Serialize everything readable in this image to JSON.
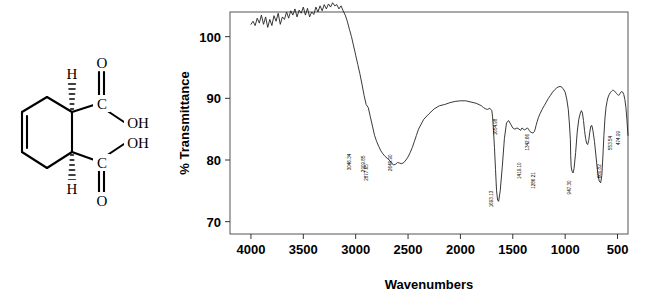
{
  "figure": {
    "caption": "",
    "structure": {
      "name": "cyclohex-4-ene-1,2-dicarboxylic acid",
      "atom_labels": [
        "H",
        "O",
        "OH",
        "OH",
        "O",
        "H",
        "C",
        "C"
      ],
      "top_h": "H",
      "bottom_h": "H",
      "top_carbonyl_o": "O",
      "bottom_carbonyl_o": "O",
      "top_hydroxyl": "OH",
      "bottom_hydroxyl": "OH",
      "top_c": "C",
      "bottom_c": "C"
    }
  },
  "chart_data": {
    "type": "line",
    "title": "",
    "xlabel": "Wavenumbers",
    "ylabel": "% Transmittance",
    "xlim": [
      4200,
      400
    ],
    "ylim": [
      68,
      104
    ],
    "xticks": [
      4000,
      3500,
      3000,
      2500,
      2000,
      1500,
      1000,
      500
    ],
    "xticklabels": [
      "4000",
      "3500",
      "3000",
      "2500",
      "2000",
      "1500",
      "1000",
      "500"
    ],
    "yticks": [
      70,
      80,
      90,
      100
    ],
    "yticklabels": [
      "70",
      "80",
      "90",
      "100"
    ],
    "grid": false,
    "legend": null,
    "axis_inverted_x": true,
    "line_color": "#222222",
    "annotations": [
      {
        "label": "3046.34",
        "x": 3046.34,
        "y": 79.3
      },
      {
        "label": "2909.85",
        "x": 2909.85,
        "y": 79.0
      },
      {
        "label": "2877.65",
        "x": 2877.65,
        "y": 77.6
      },
      {
        "label": "2649.90",
        "x": 2649.9,
        "y": 79.2
      },
      {
        "label": "1654.98",
        "x": 1654.98,
        "y": 85.0
      },
      {
        "label": "1693.13",
        "x": 1693.13,
        "y": 73.3
      },
      {
        "label": "1419.10",
        "x": 1419.1,
        "y": 77.9
      },
      {
        "label": "1342.66",
        "x": 1342.66,
        "y": 82.5
      },
      {
        "label": "1286.21",
        "x": 1286.21,
        "y": 76.3
      },
      {
        "label": "947.30",
        "x": 947.3,
        "y": 75.4
      },
      {
        "label": "660.82",
        "x": 660.82,
        "y": 78.0
      },
      {
        "label": "553.54",
        "x": 553.54,
        "y": 82.6
      },
      {
        "label": "474.99",
        "x": 474.99,
        "y": 83.4
      }
    ],
    "x": [
      4000,
      3980,
      3960,
      3940,
      3920,
      3900,
      3880,
      3860,
      3840,
      3820,
      3800,
      3780,
      3760,
      3740,
      3720,
      3700,
      3680,
      3660,
      3640,
      3620,
      3600,
      3580,
      3560,
      3540,
      3520,
      3500,
      3480,
      3460,
      3440,
      3420,
      3400,
      3380,
      3360,
      3340,
      3320,
      3300,
      3280,
      3260,
      3240,
      3220,
      3200,
      3180,
      3160,
      3140,
      3120,
      3100,
      3080,
      3060,
      3040,
      3020,
      3000,
      2980,
      2960,
      2940,
      2920,
      2900,
      2880,
      2860,
      2840,
      2820,
      2800,
      2780,
      2760,
      2740,
      2720,
      2700,
      2680,
      2660,
      2640,
      2620,
      2600,
      2580,
      2560,
      2540,
      2520,
      2500,
      2480,
      2460,
      2440,
      2420,
      2400,
      2350,
      2300,
      2250,
      2200,
      2150,
      2100,
      2050,
      2000,
      1950,
      1900,
      1850,
      1800,
      1780,
      1760,
      1740,
      1720,
      1700,
      1693,
      1685,
      1675,
      1665,
      1655,
      1645,
      1635,
      1620,
      1600,
      1580,
      1560,
      1540,
      1520,
      1500,
      1480,
      1460,
      1440,
      1425,
      1419,
      1412,
      1400,
      1390,
      1375,
      1360,
      1350,
      1343,
      1335,
      1325,
      1315,
      1305,
      1295,
      1286,
      1278,
      1268,
      1255,
      1240,
      1220,
      1200,
      1180,
      1160,
      1140,
      1120,
      1100,
      1080,
      1060,
      1040,
      1020,
      1000,
      985,
      970,
      960,
      950,
      947,
      943,
      935,
      925,
      915,
      900,
      885,
      870,
      855,
      845,
      835,
      825,
      815,
      805,
      795,
      785,
      775,
      765,
      755,
      745,
      735,
      720,
      705,
      690,
      675,
      661,
      650,
      640,
      630,
      620,
      610,
      600,
      590,
      580,
      570,
      560,
      554,
      548,
      540,
      530,
      520,
      510,
      500,
      490,
      480,
      475,
      468,
      460,
      450,
      440,
      430,
      420,
      410,
      400
    ],
    "y": [
      102.0,
      102.5,
      101.8,
      103.0,
      102.2,
      103.5,
      102.0,
      103.2,
      101.5,
      102.8,
      101.8,
      103.4,
      102.5,
      103.8,
      102.0,
      103.2,
      102.8,
      104.0,
      103.0,
      104.2,
      103.5,
      104.5,
      103.2,
      104.3,
      103.8,
      104.8,
      103.5,
      104.6,
      103.2,
      104.0,
      103.6,
      104.8,
      104.0,
      105.0,
      104.2,
      105.2,
      104.5,
      105.3,
      104.8,
      105.5,
      105.0,
      105.2,
      104.5,
      105.0,
      104.2,
      103.5,
      102.5,
      101.2,
      100.0,
      98.5,
      97.0,
      95.5,
      94.0,
      92.3,
      90.5,
      89.0,
      88.5,
      87.0,
      85.5,
      84.0,
      83.0,
      82.2,
      81.5,
      81.0,
      80.6,
      80.3,
      80.0,
      79.6,
      79.2,
      79.3,
      79.6,
      79.5,
      79.4,
      79.6,
      80.0,
      80.5,
      81.2,
      82.0,
      83.0,
      84.0,
      85.0,
      86.6,
      87.5,
      88.3,
      88.8,
      89.0,
      89.3,
      89.5,
      89.6,
      89.6,
      89.4,
      89.2,
      88.8,
      88.5,
      88.3,
      88.2,
      88.4,
      88.0,
      87.0,
      85.0,
      82.0,
      78.5,
      75.0,
      73.5,
      73.3,
      75.0,
      79.0,
      83.5,
      86.0,
      86.4,
      85.8,
      85.2,
      85.0,
      85.2,
      85.0,
      84.8,
      85.0,
      85.2,
      85.0,
      84.9,
      85.0,
      85.2,
      85.0,
      84.8,
      84.6,
      84.5,
      84.4,
      84.4,
      84.6,
      85.0,
      85.6,
      86.2,
      86.9,
      87.5,
      88.2,
      88.8,
      89.4,
      90.0,
      90.5,
      91.0,
      91.4,
      91.7,
      91.9,
      91.9,
      91.6,
      91.0,
      89.9,
      88.2,
      86.0,
      83.3,
      80.7,
      79.0,
      78.2,
      77.9,
      78.6,
      81.2,
      84.5,
      86.6,
      87.6,
      88.0,
      87.6,
      86.4,
      84.8,
      83.5,
      82.7,
      82.5,
      83.2,
      84.5,
      85.5,
      85.6,
      84.8,
      83.0,
      80.5,
      78.0,
      76.6,
      76.3,
      77.5,
      80.5,
      84.0,
      86.8,
      88.5,
      89.5,
      90.2,
      90.6,
      90.9,
      91.1,
      91.2,
      91.3,
      91.3,
      91.2,
      91.0,
      90.8,
      90.6,
      90.5,
      90.6,
      90.8,
      91.0,
      91.1,
      91.0,
      90.6,
      89.8,
      88.5,
      86.5,
      84.0,
      81.2,
      78.5,
      76.5,
      75.6,
      75.4,
      76.5,
      79.5,
      83.0,
      86.0,
      88.2,
      89.5,
      90.3,
      90.8,
      91.2,
      91.5,
      91.8,
      92.0,
      92.2,
      92.0,
      91.5,
      92.0,
      91.4,
      92.1,
      91.3,
      92.0,
      91.2,
      91.7,
      90.9,
      91.5,
      90.8,
      91.0,
      90.2,
      89.0,
      87.0,
      84.2,
      81.0,
      79.0,
      78.0,
      78.3,
      80.0,
      82.0,
      84.0,
      85.6,
      86.6,
      87.2,
      87.0,
      86.5,
      85.5,
      84.4,
      83.4,
      82.8,
      82.6,
      83.5,
      85.2,
      86.8,
      88.0,
      88.7,
      89.0,
      88.7,
      87.8,
      86.4,
      85.0,
      84.0,
      83.5,
      83.4,
      84.0,
      85.4,
      86.8,
      87.8,
      88.4,
      88.8,
      89.0,
      89.1
    ]
  }
}
